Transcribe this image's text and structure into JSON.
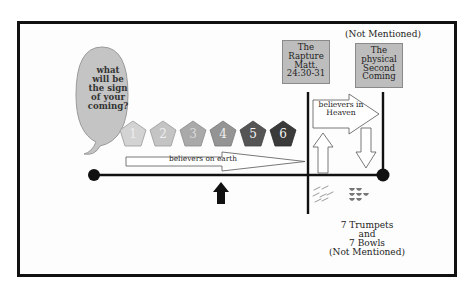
{
  "diagram": {
    "type": "timeline",
    "colors": {
      "frame": "#111111",
      "bubble": "#c4c4c4",
      "box_fill": "#bdbdbd",
      "timeline": "#111111"
    },
    "speech_bubble": {
      "lines": [
        "what",
        "will be",
        "the sign",
        "of your",
        "coming?"
      ]
    },
    "seals": [
      {
        "label": "1",
        "fill": "#d3d3d3",
        "text_color": "#eeeeee"
      },
      {
        "label": "2",
        "fill": "#c4c4c4",
        "text_color": "#eeeeee"
      },
      {
        "label": "3",
        "fill": "#a9a9a9",
        "text_color": "#d9d9d9"
      },
      {
        "label": "4",
        "fill": "#949494",
        "text_color": "#f0f0f0"
      },
      {
        "label": "5",
        "fill": "#555555",
        "text_color": "#f5f5f5"
      },
      {
        "label": "6",
        "fill": "#3a3a3a",
        "text_color": "#f5f5f5"
      }
    ],
    "earth_arrow": {
      "label": "believers on earth"
    },
    "rapture_box": {
      "lines": [
        "The",
        "Rapture",
        "Matt.",
        "24:30-31"
      ]
    },
    "second_coming": {
      "note": "(Not Mentioned)",
      "lines": [
        "The",
        "physical",
        "Second",
        "Coming"
      ]
    },
    "heaven_arrow": {
      "lines": [
        "believers in",
        "Heaven"
      ]
    },
    "bottom_note": {
      "lines": [
        "7 Trumpets",
        "and",
        "7 Bowls",
        "(Not Mentioned)"
      ]
    }
  }
}
